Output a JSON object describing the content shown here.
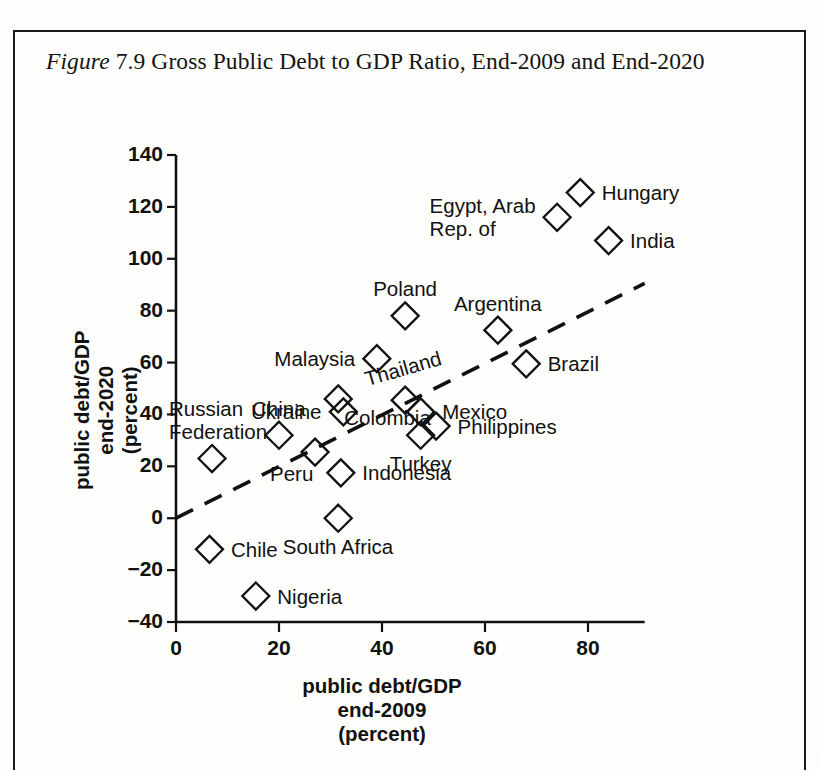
{
  "figure": {
    "label": "Figure",
    "number": "7.9",
    "title": "Gross Public Debt to GDP Ratio, End-2009 and End-2020",
    "full_caption": "Figure 7.9 Gross Public Debt to GDP Ratio, End-2009 and End-2020"
  },
  "chart_data": {
    "type": "scatter",
    "title": "Gross Public Debt to GDP Ratio, End-2009 and End-2020",
    "xlabel": "public debt/GDP\nend-2009\n(percent)",
    "xlabel_lines": [
      "public debt/GDP",
      "end-2009",
      "(percent)"
    ],
    "ylabel": "public debt/GDP\nend-2020\n(percent)",
    "ylabel_lines": [
      "public debt/GDP",
      "end-2020",
      "(percent)"
    ],
    "xlim": [
      0,
      91
    ],
    "ylim": [
      -40,
      140
    ],
    "xticks": [
      0,
      20,
      40,
      60,
      80
    ],
    "yticks": [
      -40,
      -20,
      0,
      20,
      40,
      60,
      80,
      100,
      120,
      140
    ],
    "xtick_labels": [
      "0",
      "20",
      "40",
      "60",
      "80"
    ],
    "ytick_labels": [
      "−40",
      "−20",
      "0",
      "20",
      "40",
      "60",
      "80",
      "100",
      "120",
      "140"
    ],
    "grid": false,
    "legend": "none",
    "marker_shape": "diamond-outline",
    "trendline": {
      "style": "dashed",
      "x0": 0,
      "y0": 0,
      "x1": 91,
      "y1": 90.5,
      "note": "45-degree-style reference line"
    },
    "points": [
      {
        "name": "Chile",
        "x": 6.5,
        "y": -12.0,
        "label": "Chile",
        "label_pos": "right"
      },
      {
        "name": "Russian Federation",
        "x": 7.0,
        "y": 23.0,
        "label": "Russian\nFederation",
        "label_pos": "above-left"
      },
      {
        "name": "Nigeria",
        "x": 15.5,
        "y": -30.0,
        "label": "Nigeria",
        "label_pos": "right"
      },
      {
        "name": "China",
        "x": 20.0,
        "y": 32.0,
        "label": "China",
        "label_pos": "above"
      },
      {
        "name": "Peru",
        "x": 27.0,
        "y": 25.5,
        "label": "Peru",
        "label_pos": "below-left"
      },
      {
        "name": "Colombia",
        "x": 31.5,
        "y": 46.0,
        "label": "Colombia",
        "label_pos": "below-right"
      },
      {
        "name": "Ukraine",
        "x": 32.5,
        "y": 41.0,
        "label": "Ukraine",
        "label_pos": "left"
      },
      {
        "name": "South Africa",
        "x": 31.5,
        "y": 0.0,
        "label": "South Africa",
        "label_pos": "below"
      },
      {
        "name": "Indonesia",
        "x": 32.0,
        "y": 17.5,
        "label": "Indonesia",
        "label_pos": "right"
      },
      {
        "name": "Malaysia",
        "x": 39.0,
        "y": 61.5,
        "label": "Malaysia",
        "label_pos": "left"
      },
      {
        "name": "Thailand",
        "x": 44.5,
        "y": 45.5,
        "label": "Thailand",
        "label_pos": "above",
        "rotated": true
      },
      {
        "name": "Poland",
        "x": 44.5,
        "y": 78.0,
        "label": "Poland",
        "label_pos": "above"
      },
      {
        "name": "Mexico",
        "x": 47.5,
        "y": 41.0,
        "label": "Mexico",
        "label_pos": "right"
      },
      {
        "name": "Turkey",
        "x": 47.5,
        "y": 32.0,
        "label": "Turkey",
        "label_pos": "below"
      },
      {
        "name": "Philippines",
        "x": 50.5,
        "y": 35.5,
        "label": "Philippines",
        "label_pos": "right"
      },
      {
        "name": "Argentina",
        "x": 62.5,
        "y": 72.5,
        "label": "Argentina",
        "label_pos": "above"
      },
      {
        "name": "Brazil",
        "x": 68.0,
        "y": 59.5,
        "label": "Brazil",
        "label_pos": "right"
      },
      {
        "name": "Egypt, Arab Rep. of",
        "x": 74.0,
        "y": 116.0,
        "label": "Egypt, Arab\nRep. of",
        "label_pos": "left"
      },
      {
        "name": "Hungary",
        "x": 78.5,
        "y": 125.5,
        "label": "Hungary",
        "label_pos": "right"
      },
      {
        "name": "India",
        "x": 84.0,
        "y": 107.0,
        "label": "India",
        "label_pos": "right"
      }
    ]
  }
}
